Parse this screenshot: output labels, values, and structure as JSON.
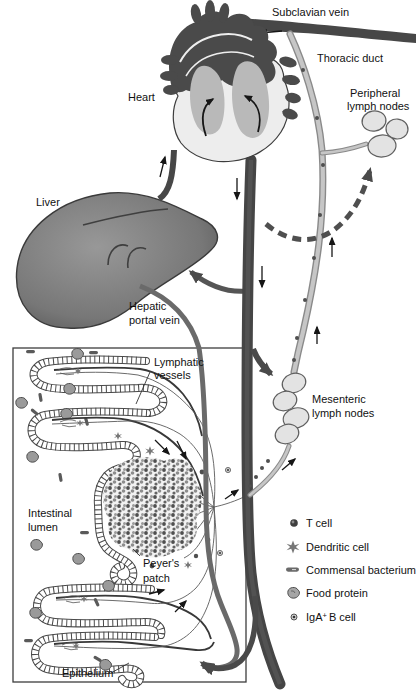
{
  "labels": {
    "subclavian_vein": "Subclavian vein",
    "thoracic_duct": "Thoracic duct",
    "heart": "Heart",
    "peripheral_lymph_nodes": {
      "line1": "Peripheral",
      "line2": "lymph nodes"
    },
    "liver": "Liver",
    "hepatic_portal_vein": {
      "line1": "Hepatic",
      "line2": "portal vein"
    },
    "lymphatic_vessels": {
      "line1": "Lymphatic",
      "line2": "vessels"
    },
    "intestinal_lumen": {
      "line1": "Intestinal",
      "line2": "lumen"
    },
    "peyers_patch": {
      "line1": "Peyer's",
      "line2": "patch"
    },
    "mesenteric_lymph_nodes": {
      "line1": "Mesenteric",
      "line2": "lymph nodes"
    },
    "epithelium": "Epithelium"
  },
  "legend": {
    "items": [
      {
        "icon": "t-cell-icon",
        "label": "T cell"
      },
      {
        "icon": "dendritic-cell-icon",
        "label": "Dendritic cell"
      },
      {
        "icon": "commensal-bacterium-icon",
        "label": "Commensal bacterium"
      },
      {
        "icon": "food-protein-icon",
        "label": "Food protein"
      },
      {
        "icon": "iga-b-cell-icon",
        "label_pre": "IgA",
        "label_sup": "+",
        "label_post": "B cell"
      }
    ]
  },
  "colors": {
    "blood_vessel_dark": "#474747",
    "lymph_vessel_fill": "#c6c6c6",
    "lymph_vessel_outline": "#8a8a8a",
    "lymph_node_fill": "#e3e3e3",
    "liver_fill": "#7a7a7a",
    "heart_chamber": "#b9b9b9",
    "text": "#111111",
    "background": "#ffffff"
  }
}
